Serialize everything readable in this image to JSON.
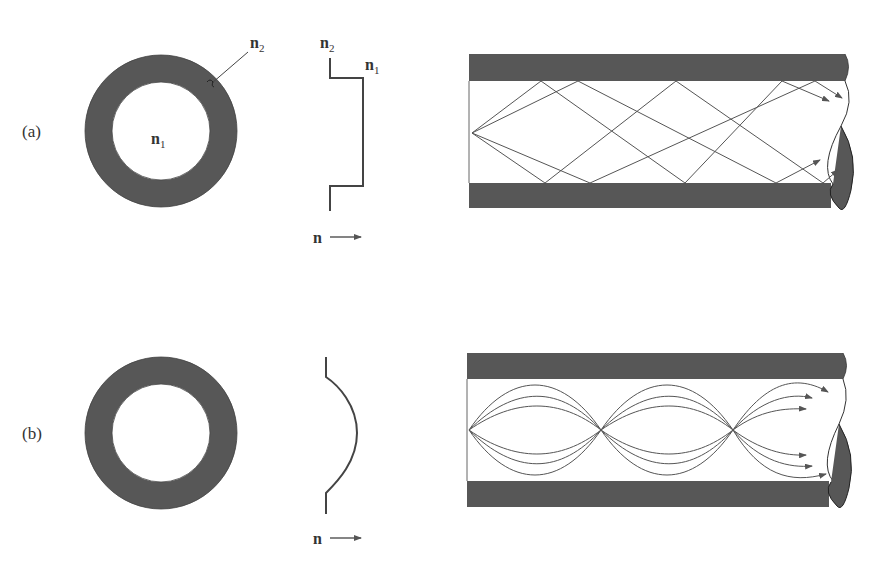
{
  "figure": {
    "panels": [
      {
        "id": "a",
        "label": "(a)",
        "cross_section": {
          "core_label": "n",
          "core_sub": "1",
          "cladding_label": "n",
          "cladding_sub": "2"
        },
        "profile": {
          "type": "step-index",
          "label_left": "n",
          "label_left_sub": "2",
          "label_right": "n",
          "label_right_sub": "1",
          "axis_label": "n"
        },
        "fiber": {
          "ray_type": "zigzag straight rays"
        }
      },
      {
        "id": "b",
        "label": "(b)",
        "profile": {
          "type": "graded-index",
          "axis_label": "n"
        },
        "fiber": {
          "ray_type": "curved sinusoidal rays refocusing"
        }
      }
    ],
    "colors": {
      "cladding": "#575757",
      "line": "#555555",
      "text": "#333333",
      "background": "#ffffff"
    }
  }
}
